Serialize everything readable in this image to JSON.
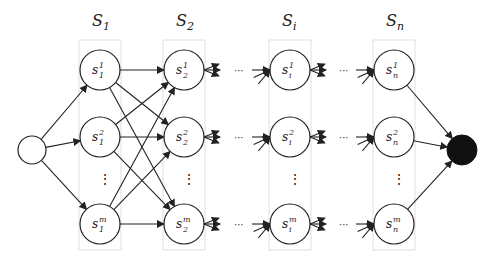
{
  "diagram": {
    "columns": [
      {
        "id": "S1",
        "label": "S",
        "sub": "1",
        "x": 100,
        "nodes": [
          {
            "sup": "1",
            "sub": "1"
          },
          {
            "sup": "2",
            "sub": "1"
          },
          {
            "sup": "m",
            "sub": "1"
          }
        ]
      },
      {
        "id": "S2",
        "label": "S",
        "sub": "2",
        "x": 184,
        "nodes": [
          {
            "sup": "1",
            "sub": "2"
          },
          {
            "sup": "2",
            "sub": "2"
          },
          {
            "sup": "m",
            "sub": "2"
          }
        ]
      },
      {
        "id": "Si",
        "label": "S",
        "sub": "i",
        "x": 290,
        "nodes": [
          {
            "sup": "1",
            "sub": "i"
          },
          {
            "sup": "2",
            "sub": "i"
          },
          {
            "sup": "m",
            "sub": "i"
          }
        ]
      },
      {
        "id": "Sn",
        "label": "S",
        "sub": "n",
        "x": 394,
        "nodes": [
          {
            "sup": "1",
            "sub": "n"
          },
          {
            "sup": "2",
            "sub": "n"
          },
          {
            "sup": "m",
            "sub": "n"
          }
        ]
      }
    ],
    "node_letter": "s",
    "vertical_ellipsis": "⋮",
    "horizontal_ellipsis": "···",
    "start_node": "source (empty circle)",
    "end_node": "sink (filled circle)",
    "colors": {
      "stroke": "#222222",
      "box": "#d8d8d8",
      "sink_fill": "#111111"
    }
  }
}
